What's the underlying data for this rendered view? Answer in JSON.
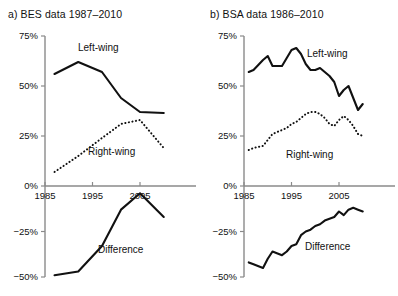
{
  "figure": {
    "panels": [
      {
        "key": "bes",
        "title": "a) BES data 1987–2010",
        "y_ticks": [
          "75%",
          "50%",
          "25%",
          "0%",
          "−25%",
          "−50%"
        ],
        "x_ticks": [
          "1985",
          "1995",
          "2005"
        ],
        "labels": {
          "left_wing": "Left-wing",
          "right_wing": "Right-wing",
          "difference": "Difference"
        }
      },
      {
        "key": "bsa",
        "title": "b) BSA data 1986–2010",
        "y_ticks": [
          "75%",
          "50%",
          "25%",
          "0%",
          "−25%",
          "−50%"
        ],
        "x_ticks": [
          "1985",
          "1995",
          "2005"
        ],
        "labels": {
          "left_wing": "Left-wing",
          "right_wing": "Right-wing",
          "difference": "Difference"
        }
      }
    ],
    "colors": {
      "line": "#111111",
      "axis": "#8a8a8a",
      "background": "#ffffff"
    }
  },
  "chart_data": [
    {
      "type": "line",
      "panel": "a",
      "title": "a) BES data 1987–2010",
      "xlabel": "",
      "ylabel": "",
      "xlim": [
        1985,
        2011
      ],
      "ylim": [
        -50,
        75
      ],
      "y_ticks": [
        75,
        50,
        25,
        0,
        -25,
        -50
      ],
      "y_ticklabels": [
        "75%",
        "50%",
        "25%",
        "0%",
        "−25%",
        "−50%"
      ],
      "x_ticks": [
        1985,
        1995,
        2005
      ],
      "x_ticklabels": [
        "1985",
        "1995",
        "2005"
      ],
      "grid": false,
      "legend": "inline-annotations",
      "series": [
        {
          "name": "Left-wing",
          "style": "solid",
          "x": [
            1987,
            1992,
            1997,
            2001,
            2005,
            2010
          ],
          "values": [
            56,
            62,
            57,
            44,
            37,
            36.5
          ]
        },
        {
          "name": "Right-wing",
          "style": "dotted",
          "x": [
            1987,
            1992,
            1997,
            2001,
            2005,
            2010
          ],
          "values": [
            7,
            15,
            24,
            31,
            33,
            19
          ]
        },
        {
          "name": "Difference",
          "style": "solid",
          "x": [
            1987,
            1992,
            1997,
            2001,
            2005,
            2010
          ],
          "values": [
            -49,
            -47,
            -33,
            -13,
            -4,
            -17
          ]
        }
      ]
    },
    {
      "type": "line",
      "panel": "b",
      "title": "b) BSA data 1986–2010",
      "xlabel": "",
      "ylabel": "",
      "xlim": [
        1985,
        2011
      ],
      "ylim": [
        -50,
        75
      ],
      "y_ticks": [
        75,
        50,
        25,
        0,
        -25,
        -50
      ],
      "y_ticklabels": [
        "75%",
        "50%",
        "25%",
        "0%",
        "−25%",
        "−50%"
      ],
      "x_ticks": [
        1985,
        1995,
        2005
      ],
      "x_ticklabels": [
        "1985",
        "1995",
        "2005"
      ],
      "grid": false,
      "legend": "inline-annotations",
      "series": [
        {
          "name": "Left-wing",
          "style": "solid",
          "x": [
            1986,
            1987,
            1989,
            1990,
            1991,
            1993,
            1994,
            1995,
            1996,
            1997,
            1998,
            1999,
            2000,
            2001,
            2002,
            2003,
            2004,
            2005,
            2006,
            2007,
            2008,
            2009,
            2010
          ],
          "values": [
            57,
            58,
            63,
            65,
            60,
            60,
            64,
            68,
            69,
            66,
            61,
            58,
            58,
            59,
            57,
            55,
            52,
            45,
            48,
            50,
            44,
            38,
            41
          ]
        },
        {
          "name": "Right-wing",
          "style": "dotted",
          "x": [
            1986,
            1987,
            1989,
            1990,
            1991,
            1993,
            1994,
            1995,
            1996,
            1997,
            1998,
            1999,
            2000,
            2001,
            2002,
            2003,
            2004,
            2005,
            2006,
            2007,
            2008,
            2009,
            2010
          ],
          "values": [
            18,
            19,
            20,
            23,
            26,
            28,
            29,
            31,
            32,
            34,
            36,
            37,
            37,
            36,
            34,
            31,
            30,
            33,
            35,
            33,
            30,
            26,
            25
          ]
        },
        {
          "name": "Difference",
          "style": "solid",
          "x": [
            1986,
            1987,
            1989,
            1990,
            1991,
            1993,
            1994,
            1995,
            1996,
            1997,
            1998,
            1999,
            2000,
            2001,
            2002,
            2003,
            2004,
            2005,
            2006,
            2007,
            2008,
            2009,
            2010
          ],
          "values": [
            -42,
            -43,
            -45,
            -40,
            -36,
            -38,
            -36,
            -33,
            -32,
            -27,
            -25,
            -24,
            -22,
            -21,
            -19,
            -18,
            -17,
            -14,
            -16,
            -13,
            -12,
            -13,
            -14
          ]
        }
      ]
    }
  ]
}
